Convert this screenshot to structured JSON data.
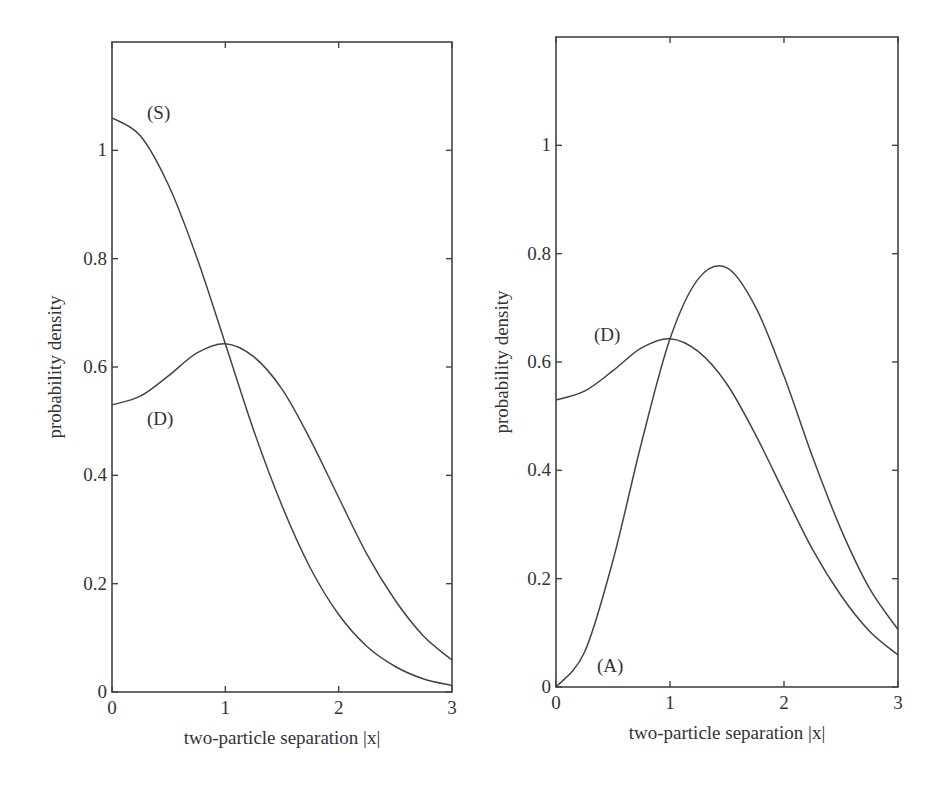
{
  "chart_data": [
    {
      "type": "line",
      "panel": "left",
      "title": "",
      "xlabel": "two-particle separation |x|",
      "ylabel": "probability density",
      "xlim": [
        0,
        3
      ],
      "ylim": [
        0,
        1.2
      ],
      "xticks": [
        0,
        1,
        2,
        3
      ],
      "xtick_labels": [
        "0",
        "1",
        "2",
        "3"
      ],
      "yticks": [
        0,
        0.2,
        0.4,
        0.6,
        0.8,
        1.0
      ],
      "ytick_labels": [
        "0",
        "0.2",
        "0.4",
        "0.6",
        "0.8",
        "1"
      ],
      "grid": false,
      "legend": "none (inline curve labels)",
      "x": [
        0,
        0.25,
        0.5,
        0.75,
        1.0,
        1.25,
        1.5,
        1.75,
        2.0,
        2.25,
        2.5,
        2.75,
        3.0
      ],
      "series": [
        {
          "name": "(S)",
          "values": [
            1.06,
            1.027,
            0.935,
            0.801,
            0.643,
            0.483,
            0.344,
            0.229,
            0.143,
            0.084,
            0.047,
            0.024,
            0.012
          ]
        },
        {
          "name": "(D)",
          "values": [
            0.53,
            0.546,
            0.584,
            0.626,
            0.643,
            0.619,
            0.559,
            0.466,
            0.359,
            0.254,
            0.169,
            0.103,
            0.059
          ]
        }
      ],
      "annotations": [
        {
          "text": "(S)",
          "x": 0.27,
          "y": 1.085
        },
        {
          "text": "(D)",
          "x": 0.27,
          "y": 0.505
        }
      ]
    },
    {
      "type": "line",
      "panel": "right",
      "title": "",
      "xlabel": "two-particle separation |x|",
      "ylabel": "probability density",
      "xlim": [
        0,
        3
      ],
      "ylim": [
        0,
        1.2
      ],
      "xticks": [
        0,
        1,
        2,
        3
      ],
      "xtick_labels": [
        "0",
        "1",
        "2",
        "3"
      ],
      "yticks": [
        0,
        0.2,
        0.4,
        0.6,
        0.8,
        1.0
      ],
      "ytick_labels": [
        "0",
        "0.2",
        "0.4",
        "0.6",
        "0.8",
        "1"
      ],
      "grid": false,
      "legend": "none (inline curve labels)",
      "x": [
        0,
        0.25,
        0.5,
        0.75,
        1.0,
        1.25,
        1.5,
        1.75,
        2.0,
        2.25,
        2.5,
        2.75,
        3.0
      ],
      "series": [
        {
          "name": "(D)",
          "values": [
            0.53,
            0.546,
            0.584,
            0.626,
            0.643,
            0.619,
            0.559,
            0.466,
            0.359,
            0.254,
            0.169,
            0.103,
            0.059
          ]
        },
        {
          "name": "(A)",
          "values": [
            0.0,
            0.064,
            0.234,
            0.451,
            0.643,
            0.754,
            0.774,
            0.702,
            0.574,
            0.425,
            0.291,
            0.182,
            0.106
          ]
        }
      ],
      "annotations": [
        {
          "text": "(D)",
          "x": 0.27,
          "y": 0.67
        },
        {
          "text": "(A)",
          "x": 0.27,
          "y": 0.04
        }
      ]
    }
  ],
  "panels": {
    "left": {
      "xlabel": "two-particle separation |x|",
      "ylabel": "probability density",
      "labels": {
        "s": "(S)",
        "d": "(D)"
      }
    },
    "right": {
      "xlabel": "two-particle separation |x|",
      "ylabel": "probability density",
      "labels": {
        "d": "(D)",
        "a": "(A)"
      }
    }
  },
  "style": {
    "line_color": "#444444",
    "background": "#ffffff"
  }
}
